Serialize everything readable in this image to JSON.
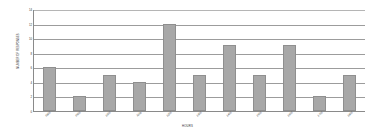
{
  "chart_data": {
    "type": "bar",
    "title": "",
    "xlabel": "HOURS",
    "ylabel": "NUMBER OF RESPONSES",
    "categories": [
      "0800",
      "0900",
      "1000",
      "1100",
      "1200",
      "1300",
      "1400",
      "1500",
      "1600",
      "1700",
      "1800"
    ],
    "values": [
      6,
      2,
      5,
      4,
      12,
      5,
      9,
      5,
      9,
      2,
      5
    ],
    "ylim": [
      0,
      14
    ],
    "ytick_labels": [
      "0",
      "2",
      "4",
      "6",
      "8",
      "10",
      "12",
      "14"
    ],
    "ytick_values": [
      0,
      2,
      4,
      6,
      8,
      10,
      12,
      14
    ],
    "grid": true,
    "legend": false,
    "bar_color": "#a8a8a8",
    "bar_border_color": "#8f8f8f",
    "grid_color": "#9c9c9c",
    "axis_color": "#8a8a8a",
    "background_color": "#ffffff"
  }
}
